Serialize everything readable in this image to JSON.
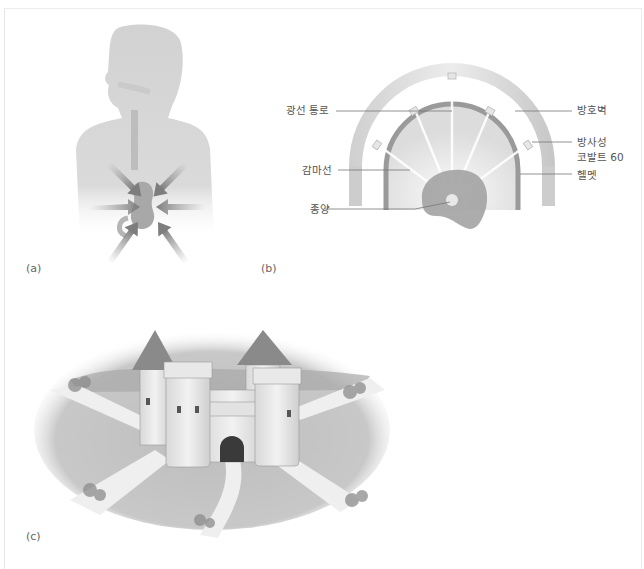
{
  "figure": {
    "panels": [
      {
        "id": "a",
        "label": "(a)",
        "subject": "human silhouette with converging radiation arrows toward internal organ"
      },
      {
        "id": "b",
        "label": "(b)",
        "subject": "gamma knife helmet cross-section diagram"
      },
      {
        "id": "c",
        "label": "(c)",
        "subject": "castle with multiple roads converging at gate"
      }
    ],
    "panel_b_callouts": {
      "beam_channel": "광선 통로",
      "shield_wall": "방호벽",
      "cobalt_line1": "방사성",
      "cobalt_line2": "코발트 60",
      "gamma_ray": "감마선",
      "helmet": "헬멧",
      "tumor": "종양"
    },
    "colors": {
      "silhouette": "#d4d4d4",
      "arrow": "#8c8c8c",
      "shield": "#c8c8c8",
      "helmet_band": "#9a9a9a",
      "tumor": "#9e9e9e",
      "roof": "#8a8a8a",
      "ground": "#bdbdbd",
      "road": "#ededed",
      "frame": "#e6e6e6"
    }
  }
}
